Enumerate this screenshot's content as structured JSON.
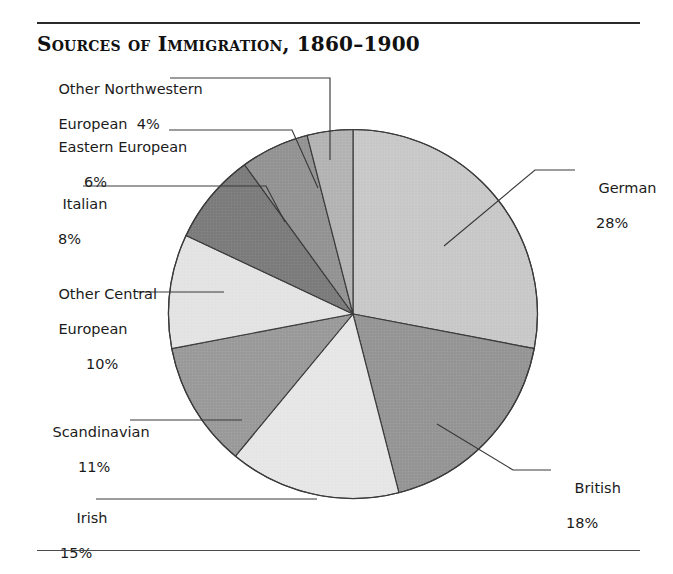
{
  "figure": {
    "title": "Sources of Immigration, 1860–1900"
  },
  "chart_data": {
    "type": "pie",
    "title": "Sources of Immigration, 1860–1900",
    "xlabel": "",
    "ylabel": "",
    "units": "percent",
    "start_angle_deg": 0,
    "direction": "clockwise",
    "legend": "none (direct labels with leader lines)",
    "grid": false,
    "labels": [
      "German",
      "British",
      "Irish",
      "Scandinavian",
      "Other Central European",
      "Italian",
      "Eastern European",
      "Other Northwestern European"
    ],
    "values": [
      28,
      18,
      15,
      11,
      10,
      8,
      6,
      4
    ],
    "slices": [
      {
        "name": "German",
        "label": "German",
        "percent": 28,
        "percent_text": "28%",
        "color": "#c9c9c9",
        "label_position": "right"
      },
      {
        "name": "British",
        "label": "British",
        "percent": 18,
        "percent_text": "18%",
        "color": "#969696",
        "label_position": "right"
      },
      {
        "name": "Irish",
        "label": "Irish",
        "percent": 15,
        "percent_text": "15%",
        "color": "#e7e7e7",
        "label_position": "bottom-left"
      },
      {
        "name": "Scandinavian",
        "label": "Scandinavian",
        "percent": 11,
        "percent_text": "11%",
        "color": "#9b9b9b",
        "label_position": "left"
      },
      {
        "name": "Other Central European",
        "label": "Other Central\nEuropean",
        "percent": 10,
        "percent_text": "10%",
        "color": "#e4e4e4",
        "label_position": "left"
      },
      {
        "name": "Italian",
        "label": "Italian",
        "percent": 8,
        "percent_text": "8%",
        "color": "#7c7c7c",
        "label_position": "left"
      },
      {
        "name": "Eastern European",
        "label": "Eastern European",
        "percent": 6,
        "percent_text": "6%",
        "color": "#949494",
        "label_position": "left"
      },
      {
        "name": "Other Northwestern European",
        "label": "Other Northwestern\nEuropean",
        "percent": 4,
        "percent_text": "4%",
        "color": "#b4b4b4",
        "label_position": "top-left"
      }
    ]
  },
  "labels": {
    "other_northwestern": {
      "line1": "Other Northwestern",
      "line2": "European  4%"
    },
    "eastern_european": {
      "name": "Eastern European",
      "pct": "6%"
    },
    "italian": {
      "name": "Italian",
      "pct": "8%"
    },
    "other_central": {
      "line1": "Other Central",
      "line2": "European",
      "pct": "10%"
    },
    "scandinavian": {
      "name": "Scandinavian",
      "pct": "11%"
    },
    "irish": {
      "name": "Irish",
      "pct": "15%"
    },
    "german": {
      "name": "German",
      "pct": "28%"
    },
    "british": {
      "name": "British",
      "pct": "18%"
    }
  }
}
